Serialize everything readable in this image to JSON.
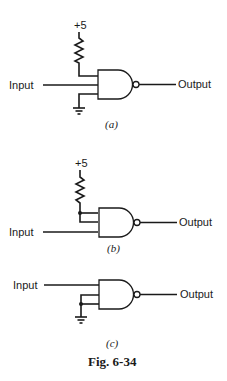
{
  "figure": {
    "caption": "Fig. 6-34",
    "panels": [
      {
        "id": "a",
        "sublabel": "(a)",
        "supply_label": "+5",
        "input_label": "Input",
        "output_label": "Output",
        "gate": "NAND",
        "description": "Unused input tied to +5 through a pull-up resistor, other unused input tied to ground"
      },
      {
        "id": "b",
        "sublabel": "(b)",
        "supply_label": "+5",
        "input_label": "Input",
        "output_label": "Output",
        "gate": "NAND",
        "description": "Two unused inputs tied together to +5 through a pull-up resistor"
      },
      {
        "id": "c",
        "sublabel": "(c)",
        "input_label": "Input",
        "output_label": "Output",
        "gate": "NAND",
        "description": "Two unused inputs tied together to ground"
      }
    ]
  }
}
